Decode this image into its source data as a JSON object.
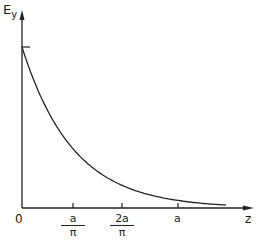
{
  "figure": {
    "y_label": "E",
    "y_label_sub": "y",
    "x_label": "z",
    "origin_label": "0",
    "ticks": [
      {
        "num": "a",
        "den": "π"
      },
      {
        "num": "2a",
        "den": "π"
      },
      {
        "plain": "a"
      }
    ]
  },
  "chart_data": {
    "type": "line",
    "title": "",
    "xlabel": "z",
    "ylabel": "E_y",
    "x_tick_labels": [
      "0",
      "a/π",
      "2a/π",
      "a"
    ],
    "x_tick_values": [
      0,
      0.318,
      0.637,
      1.0
    ],
    "series": [
      {
        "name": "E_y(z) ~ exp(-π z / a)",
        "x": [
          0,
          0.1,
          0.2,
          0.318,
          0.4,
          0.5,
          0.637,
          0.8,
          1.0,
          1.2
        ],
        "y": [
          1.0,
          0.73,
          0.53,
          0.37,
          0.28,
          0.21,
          0.135,
          0.081,
          0.043,
          0.023
        ]
      }
    ],
    "y_marker": {
      "at": 1.0,
      "note": "short tick marking initial value on y-axis"
    },
    "grid": false,
    "legend": false
  }
}
